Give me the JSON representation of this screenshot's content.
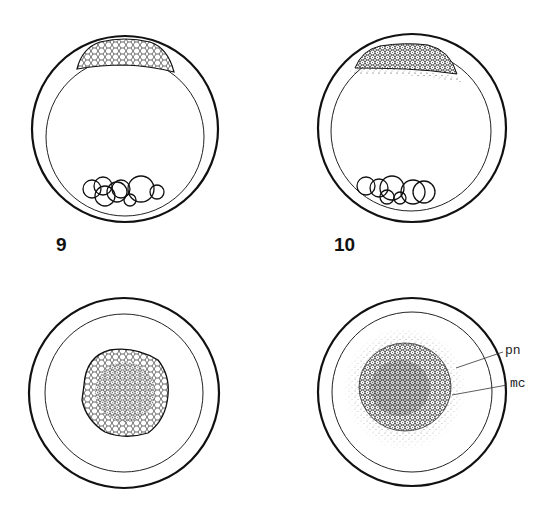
{
  "figure": {
    "panels": [
      {
        "id": "9",
        "view": "lateral",
        "label": "9"
      },
      {
        "id": "10",
        "view": "lateral",
        "label": "10"
      },
      {
        "id": "9-animal",
        "view": "animal-pole",
        "label": ""
      },
      {
        "id": "10-animal",
        "view": "animal-pole",
        "label": ""
      }
    ],
    "annotations": [
      {
        "text": "pn",
        "panel": "10-animal"
      },
      {
        "text": "mc",
        "panel": "10-animal"
      }
    ],
    "colors": {
      "ink": "#111111",
      "background": "#ffffff"
    }
  }
}
